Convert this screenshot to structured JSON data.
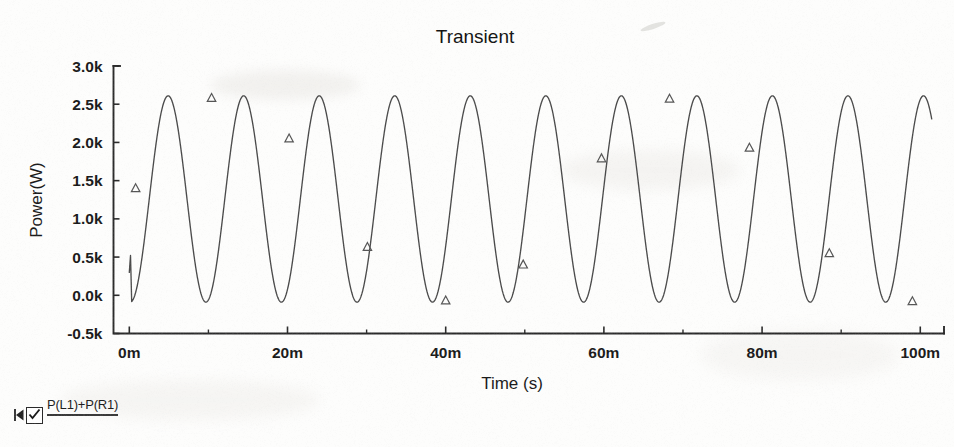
{
  "chart_data": {
    "type": "line",
    "title": "Transient",
    "xlabel": "Time (s)",
    "ylabel": "Power(W)",
    "xlim": [
      -2,
      103
    ],
    "ylim": [
      -0.5,
      3.0
    ],
    "x_unit": "m",
    "y_unit": "k",
    "grid": false,
    "legend_position": "below-left",
    "x_tick_labels": [
      "0m",
      "20m",
      "40m",
      "60m",
      "80m",
      "100m"
    ],
    "x_tick_values": [
      0,
      20,
      40,
      60,
      80,
      100
    ],
    "x_minor_tick_values": [
      10,
      30,
      50,
      70,
      90
    ],
    "y_tick_labels": [
      "3.0k",
      "2.5k",
      "2.0k",
      "1.5k",
      "1.0k",
      "0.5k",
      "0.0k",
      "-0.5k"
    ],
    "y_tick_values": [
      3.0,
      2.5,
      2.0,
      1.5,
      1.0,
      0.5,
      0.0,
      -0.5
    ],
    "series": [
      {
        "name": "P(L1)+P(R1)",
        "color": "#4a4a4a",
        "marker": "triangle",
        "waveform": "rectified-sine",
        "amplitude_k": 1.35,
        "offset_k": 1.26,
        "period_ms": 9.55,
        "phase_deg": -95,
        "t_start_ms": 0.3,
        "t_end_ms": 101.5,
        "y_min_k": -0.09,
        "y_max_k": 2.61,
        "marker_points": [
          {
            "t": 0.8,
            "y": 1.4
          },
          {
            "t": 10.4,
            "y": 2.58
          },
          {
            "t": 20.2,
            "y": 2.05
          },
          {
            "t": 30.1,
            "y": 0.63
          },
          {
            "t": 40.0,
            "y": -0.07
          },
          {
            "t": 49.8,
            "y": 0.4
          },
          {
            "t": 59.7,
            "y": 1.79
          },
          {
            "t": 68.3,
            "y": 2.57
          },
          {
            "t": 78.4,
            "y": 1.93
          },
          {
            "t": 88.5,
            "y": 0.55
          },
          {
            "t": 99.0,
            "y": -0.08
          }
        ]
      }
    ]
  },
  "chart": {
    "title": "Transient",
    "x_axis_title": "Time (s)",
    "y_axis_title": "Power(W)"
  },
  "legend": {
    "label": "P(L1)+P(R1)",
    "checked": true,
    "handle_icon": "drag-handle-icon",
    "checkbox_icon": "checkbox-checked-icon"
  }
}
